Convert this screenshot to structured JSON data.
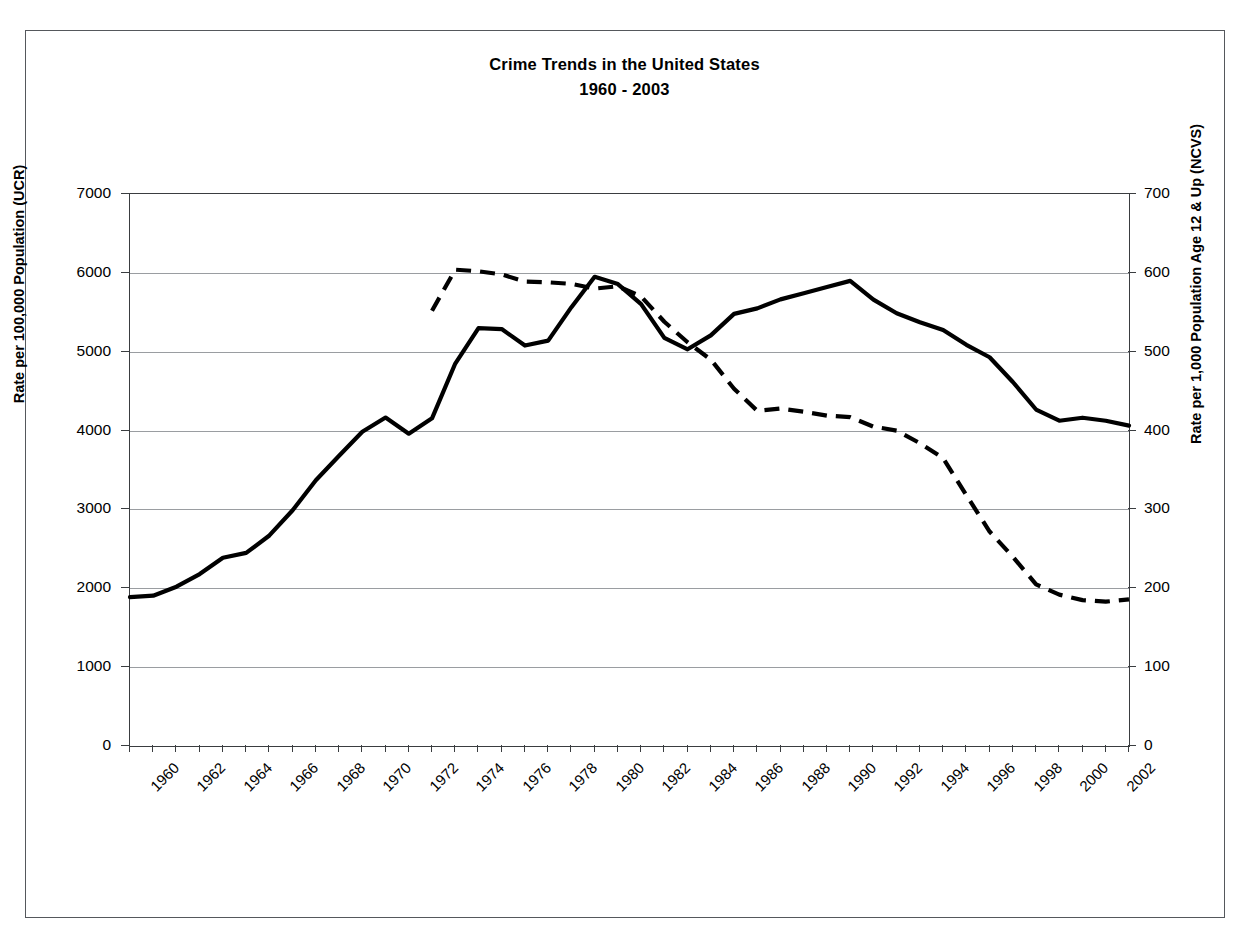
{
  "chart_data": {
    "type": "line",
    "title": "Crime Trends in the United States",
    "subtitle": "1960 - 2003",
    "xlabel": "",
    "ylabel": "Rate per 100,000 Population (UCR)",
    "y2label": "Rate per 1,000 Population Age 12 & Up (NCVS)",
    "ylim": [
      0,
      7000
    ],
    "y2lim": [
      0,
      700
    ],
    "xlim": [
      1960,
      2003
    ],
    "grid": true,
    "legend": "none",
    "y_ticks": [
      "0",
      "1000",
      "2000",
      "3000",
      "4000",
      "5000",
      "6000",
      "7000"
    ],
    "y_tick_values": [
      0,
      1000,
      2000,
      3000,
      4000,
      5000,
      6000,
      7000
    ],
    "y2_ticks": [
      "0",
      "100",
      "200",
      "300",
      "400",
      "500",
      "600",
      "700"
    ],
    "y2_tick_values": [
      0,
      100,
      200,
      300,
      400,
      500,
      600,
      700
    ],
    "x_ticks": [
      "1960",
      "1962",
      "1964",
      "1966",
      "1968",
      "1970",
      "1972",
      "1974",
      "1976",
      "1978",
      "1980",
      "1982",
      "1984",
      "1986",
      "1988",
      "1990",
      "1992",
      "1994",
      "1996",
      "1998",
      "2000",
      "2002"
    ],
    "x_tick_values": [
      1960,
      1962,
      1964,
      1966,
      1968,
      1970,
      1972,
      1974,
      1976,
      1978,
      1980,
      1982,
      1984,
      1986,
      1988,
      1990,
      1992,
      1994,
      1996,
      1998,
      2000,
      2002
    ],
    "series": [
      {
        "name": "UCR Crime Rate",
        "axis": "left",
        "style": "solid",
        "color": "#000000",
        "linewidth": 4,
        "x": [
          1960,
          1961,
          1962,
          1963,
          1964,
          1965,
          1966,
          1967,
          1968,
          1969,
          1970,
          1971,
          1972,
          1973,
          1974,
          1975,
          1976,
          1977,
          1978,
          1979,
          1980,
          1981,
          1982,
          1983,
          1984,
          1985,
          1986,
          1987,
          1988,
          1989,
          1990,
          1991,
          1992,
          1993,
          1994,
          1995,
          1996,
          1997,
          1998,
          1999,
          2000,
          2001,
          2002,
          2003
        ],
        "values": [
          1887,
          1906,
          2020,
          2180,
          2388,
          2449,
          2670,
          2990,
          3370,
          3680,
          3985,
          4165,
          3961,
          4155,
          4850,
          5298,
          5287,
          5078,
          5140,
          5565,
          5950,
          5858,
          5604,
          5175,
          5031,
          5207,
          5480,
          5550,
          5664,
          5741,
          5820,
          5898,
          5661,
          5487,
          5374,
          5275,
          5087,
          4930,
          4616,
          4267,
          4125,
          4163,
          4125,
          4063
        ]
      },
      {
        "name": "NCVS Victimization Rate",
        "axis": "right",
        "style": "dashed",
        "color": "#000000",
        "linewidth": 4,
        "x": [
          1973,
          1974,
          1975,
          1976,
          1977,
          1978,
          1979,
          1980,
          1981,
          1982,
          1983,
          1984,
          1985,
          1986,
          1987,
          1988,
          1989,
          1990,
          1991,
          1992,
          1993,
          1994,
          1995,
          1996,
          1997,
          1998,
          1999,
          2000,
          2001,
          2002,
          2003
        ],
        "values": [
          552,
          604,
          602,
          598,
          589,
          588,
          586,
          580,
          583,
          570,
          538,
          512,
          490,
          453,
          425,
          428,
          424,
          419,
          417,
          405,
          400,
          384,
          365,
          318,
          272,
          240,
          205,
          192,
          185,
          183,
          186
        ]
      }
    ]
  },
  "title": {
    "line1": "Crime Trends in the United States",
    "line2": "1960 - 2003"
  },
  "axes": {
    "left_title": "Rate per 100,000 Population (UCR)",
    "right_title": "Rate per 1,000 Population Age 12 & Up (NCVS)"
  }
}
